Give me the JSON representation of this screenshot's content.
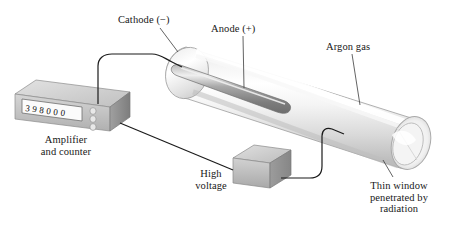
{
  "figure": {
    "background_color": "#ffffff",
    "labels": {
      "cathode": "Cathode (−)",
      "anode": "Anode (+)",
      "argon_gas": "Argon gas",
      "amplifier_line1": "Amplifier",
      "amplifier_line2": "and counter",
      "high_voltage_line1": "High",
      "high_voltage_line2": "voltage",
      "thin_window_line1": "Thin window",
      "thin_window_line2": "penetrated by",
      "thin_window_line3": "radiation"
    },
    "counter": {
      "display_value": "398000",
      "digits": [
        "3",
        "9",
        "8",
        "0",
        "0",
        "0"
      ],
      "button_count": 3
    },
    "colors": {
      "tube_body": "#e9e9e9",
      "tube_highlight": "#ffffff",
      "tube_shadow": "#b9b9b9",
      "electrode_rod": "#9a9a9a",
      "electrode_rod_highlight": "#e6e6e6",
      "box_top": "#d4d4d4",
      "box_front": "#bdbdbd",
      "box_side": "#8e8e8e",
      "wire": "#1b1b1b",
      "leader_line": "#4a4a4a",
      "text": "#181818"
    }
  }
}
